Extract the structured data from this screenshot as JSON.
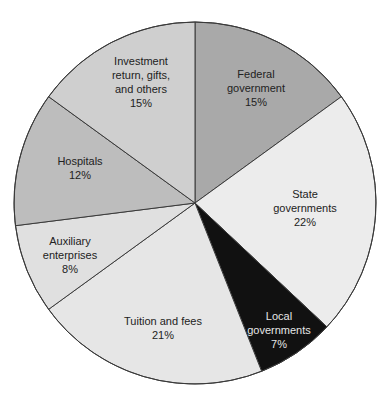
{
  "chart_data": {
    "type": "pie",
    "title": "",
    "start_angle_deg": -90,
    "direction": "clockwise",
    "center": [
      195,
      203
    ],
    "radius": 181,
    "slices": [
      {
        "label": "Federal government",
        "lines": [
          "Federal",
          "government"
        ],
        "pct_label": "15%",
        "value": 15,
        "color": "#a9a9a9",
        "text_color": "#222222",
        "label_pos": [
          256,
          78
        ]
      },
      {
        "label": "State governments",
        "lines": [
          "State",
          "governments"
        ],
        "pct_label": "22%",
        "value": 22,
        "color": "#ececec",
        "text_color": "#222222",
        "label_pos": [
          305,
          198
        ]
      },
      {
        "label": "Local governments",
        "lines": [
          "Local",
          "governments"
        ],
        "pct_label": "7%",
        "value": 7,
        "color": "#111111",
        "text_color": "#e6e6e6",
        "label_pos": [
          279,
          320
        ]
      },
      {
        "label": "Tuition and fees",
        "lines": [
          "Tuition and fees"
        ],
        "pct_label": "21%",
        "value": 21,
        "color": "#e6e6e6",
        "text_color": "#222222",
        "label_pos": [
          163,
          325
        ]
      },
      {
        "label": "Auxiliary enterprises",
        "lines": [
          "Auxiliary",
          "enterprises"
        ],
        "pct_label": "8%",
        "value": 8,
        "color": "#e0e0e0",
        "text_color": "#222222",
        "label_pos": [
          70,
          245
        ]
      },
      {
        "label": "Hospitals",
        "lines": [
          "Hospitals"
        ],
        "pct_label": "12%",
        "value": 12,
        "color": "#bdbdbd",
        "text_color": "#222222",
        "label_pos": [
          80,
          165
        ]
      },
      {
        "label": "Investment return, gifts, and others",
        "lines": [
          "Investment",
          "return, gifts,",
          "and others"
        ],
        "pct_label": "15%",
        "value": 15,
        "color": "#cfcfcf",
        "text_color": "#222222",
        "label_pos": [
          141,
          65
        ]
      }
    ],
    "legend": null
  }
}
